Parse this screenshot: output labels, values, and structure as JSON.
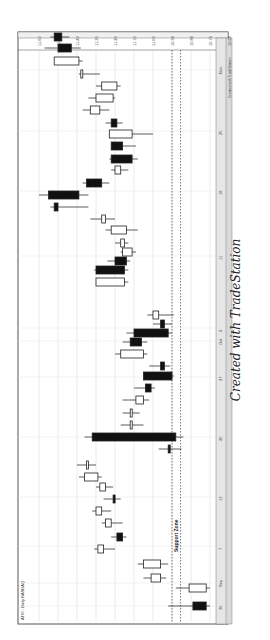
{
  "chart_data": {
    "type": "candlestick",
    "title": "ATVI - Daily NASDAQ",
    "orientation": "rotated-90",
    "annotation": "Support Zone",
    "watermark": "Created with TradeStation",
    "credit": "Created with TradeStation",
    "price_ticks": [
      "11.60",
      "11.50",
      "11.40",
      "11.30",
      "11.20",
      "11.10",
      "11.00",
      "10.90",
      "10.80",
      "10.70",
      "10.60"
    ],
    "date_ticks": [
      {
        "label": "30",
        "pos": 606
      },
      {
        "label": "Sep",
        "pos": 583
      },
      {
        "label": "7",
        "pos": 546
      },
      {
        "label": "13",
        "pos": 497
      },
      {
        "label": "20",
        "pos": 437
      },
      {
        "label": "27",
        "pos": 377
      },
      {
        "label": "Oct",
        "pos": 341
      },
      {
        "label": "4",
        "pos": 328
      },
      {
        "label": "11",
        "pos": 256
      },
      {
        "label": "18",
        "pos": 191
      },
      {
        "label": "25",
        "pos": 131
      },
      {
        "label": "Nov",
        "pos": 70
      }
    ],
    "support_zone": [
      10.9,
      10.855
    ],
    "candles": [
      {
        "pos": 606,
        "open": 10.79,
        "close": 10.72,
        "high": 10.92,
        "low": 10.7,
        "bear": true
      },
      {
        "pos": 588,
        "open": 10.72,
        "close": 10.81,
        "high": 10.88,
        "low": 10.7,
        "bear": false
      },
      {
        "pos": 578,
        "open": 10.96,
        "close": 11.01,
        "high": 10.93,
        "low": 11.05,
        "bear": false
      },
      {
        "pos": 564,
        "open": 10.96,
        "close": 11.05,
        "high": 10.92,
        "low": 11.08,
        "bear": false
      },
      {
        "pos": 549,
        "open": 11.29,
        "close": 11.26,
        "high": 11.2,
        "low": 11.31,
        "bear": false
      },
      {
        "pos": 537,
        "open": 11.19,
        "close": 11.16,
        "high": 11.14,
        "low": 11.22,
        "bear": true
      },
      {
        "pos": 523,
        "open": 11.25,
        "close": 11.22,
        "high": 11.16,
        "low": 11.27,
        "bear": false
      },
      {
        "pos": 511,
        "open": 11.3,
        "close": 11.27,
        "high": 11.22,
        "low": 11.32,
        "bear": false
      },
      {
        "pos": 499,
        "open": 11.21,
        "close": 11.2,
        "high": 11.17,
        "low": 11.26,
        "bear": true
      },
      {
        "pos": 487,
        "open": 11.28,
        "close": 11.25,
        "high": 11.21,
        "low": 11.3,
        "bear": false
      },
      {
        "pos": 477,
        "open": 11.36,
        "close": 11.29,
        "high": 11.27,
        "low": 11.39,
        "bear": false
      },
      {
        "pos": 465,
        "open": 11.35,
        "close": 11.34,
        "high": 11.3,
        "low": 11.4,
        "bear": false
      },
      {
        "pos": 449,
        "open": 10.92,
        "close": 10.91,
        "high": 10.85,
        "low": 10.97,
        "bear": true
      },
      {
        "pos": 437,
        "open": 10.88,
        "close": 11.32,
        "high": 10.84,
        "low": 11.36,
        "bear": true
      },
      {
        "pos": 425,
        "open": 11.12,
        "close": 11.11,
        "high": 11.05,
        "low": 11.17,
        "bear": false
      },
      {
        "pos": 413,
        "open": 11.12,
        "close": 11.11,
        "high": 11.07,
        "low": 11.16,
        "bear": false
      },
      {
        "pos": 400,
        "open": 11.09,
        "close": 11.05,
        "high": 11.02,
        "low": 11.16,
        "bear": false
      },
      {
        "pos": 388,
        "open": 11.04,
        "close": 11.01,
        "high": 10.99,
        "low": 11.1,
        "bear": true
      },
      {
        "pos": 376,
        "open": 10.9,
        "close": 11.05,
        "high": 10.89,
        "low": 11.03,
        "bear": true
      },
      {
        "pos": 366,
        "open": 10.94,
        "close": 10.96,
        "high": 10.91,
        "low": 11.02,
        "bear": true
      },
      {
        "pos": 354,
        "open": 11.05,
        "close": 11.17,
        "high": 11.03,
        "low": 11.2,
        "bear": false
      },
      {
        "pos": 342,
        "open": 11.12,
        "close": 11.06,
        "high": 11.03,
        "low": 11.16,
        "bear": true
      },
      {
        "pos": 333,
        "open": 10.92,
        "close": 11.1,
        "high": 10.9,
        "low": 11.14,
        "bear": true
      },
      {
        "pos": 324,
        "open": 10.96,
        "close": 10.94,
        "high": 10.9,
        "low": 11.0,
        "bear": true
      },
      {
        "pos": 315,
        "open": 10.97,
        "close": 11.0,
        "high": 10.89,
        "low": 11.03,
        "bear": false
      },
      {
        "pos": 282,
        "open": 11.15,
        "close": 11.3,
        "high": 11.13,
        "low": 11.3,
        "bear": false
      },
      {
        "pos": 270,
        "open": 11.15,
        "close": 11.3,
        "high": 11.13,
        "low": 11.31,
        "bear": true
      },
      {
        "pos": 261,
        "open": 11.14,
        "close": 11.2,
        "high": 11.12,
        "low": 11.24,
        "bear": true
      },
      {
        "pos": 252,
        "open": 11.16,
        "close": 11.11,
        "high": 11.09,
        "low": 11.17,
        "bear": false
      },
      {
        "pos": 243,
        "open": 11.17,
        "close": 11.15,
        "high": 11.13,
        "low": 11.2,
        "bear": false
      },
      {
        "pos": 230,
        "open": 11.22,
        "close": 11.14,
        "high": 11.08,
        "low": 11.25,
        "bear": false
      },
      {
        "pos": 219,
        "open": 11.27,
        "close": 11.25,
        "high": 11.2,
        "low": 11.33,
        "bear": false
      },
      {
        "pos": 207,
        "open": 11.52,
        "close": 11.5,
        "high": 11.34,
        "low": 11.54,
        "bear": true
      },
      {
        "pos": 195,
        "open": 11.55,
        "close": 11.39,
        "high": 11.34,
        "low": 11.6,
        "bear": true
      },
      {
        "pos": 183,
        "open": 11.35,
        "close": 11.27,
        "high": 11.23,
        "low": 11.37,
        "bear": true
      },
      {
        "pos": 170,
        "open": 11.2,
        "close": 11.17,
        "high": 11.13,
        "low": 11.22,
        "bear": false
      },
      {
        "pos": 159,
        "open": 11.22,
        "close": 11.11,
        "high": 11.08,
        "low": 11.23,
        "bear": true
      },
      {
        "pos": 146,
        "open": 11.22,
        "close": 11.16,
        "high": 11.09,
        "low": 11.22,
        "bear": true
      },
      {
        "pos": 134,
        "open": 11.23,
        "close": 11.11,
        "high": 11.0,
        "low": 11.23,
        "bear": false
      },
      {
        "pos": 123,
        "open": 11.22,
        "close": 11.19,
        "high": 11.16,
        "low": 11.25,
        "bear": true
      },
      {
        "pos": 110,
        "open": 11.33,
        "close": 11.28,
        "high": 11.23,
        "low": 11.37,
        "bear": false
      },
      {
        "pos": 98,
        "open": 11.3,
        "close": 11.21,
        "high": 11.2,
        "low": 11.34,
        "bear": false
      },
      {
        "pos": 86,
        "open": 11.27,
        "close": 11.19,
        "high": 11.17,
        "low": 11.3,
        "bear": false
      },
      {
        "pos": 74,
        "open": 11.38,
        "close": 11.37,
        "high": 11.28,
        "low": 11.39,
        "bear": false
      },
      {
        "pos": 61,
        "open": 11.52,
        "close": 11.39,
        "high": 11.37,
        "low": 11.47,
        "bear": false
      },
      {
        "pos": 48,
        "open": 11.5,
        "close": 11.43,
        "high": 11.38,
        "low": 11.57,
        "bear": true
      },
      {
        "pos": 37,
        "open": 11.52,
        "close": 11.48,
        "high": 11.44,
        "low": 11.54,
        "bear": true
      }
    ]
  }
}
